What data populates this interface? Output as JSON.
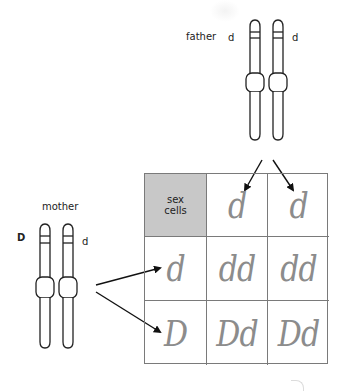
{
  "father": {
    "label": "father",
    "alleles": [
      "d",
      "d"
    ]
  },
  "mother": {
    "label": "mother",
    "alleles": [
      "D",
      "d"
    ]
  },
  "punnett": {
    "header": [
      "sex",
      "cells"
    ],
    "father_gametes": [
      "d",
      "d"
    ],
    "mother_gametes": [
      "d",
      "D"
    ],
    "offspring": [
      [
        "dd",
        "dd"
      ],
      [
        "Dd",
        "Dd"
      ]
    ]
  },
  "colors": {
    "header_fill": "#c8c8c8",
    "grid_line": "#7a7a7a",
    "handwriting": "#8c8c8c",
    "ink": "#222222"
  }
}
